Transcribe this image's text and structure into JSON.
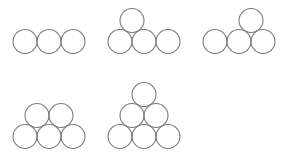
{
  "diagram": {
    "stroke_color": "#7a7a7a",
    "radius": 12,
    "groups": [
      {
        "name": "row-of-three",
        "circles": [
          {
            "cx": 25,
            "cy": 41.5
          },
          {
            "cx": 49,
            "cy": 41.5
          },
          {
            "cx": 73,
            "cy": 41.5
          }
        ]
      },
      {
        "name": "four-with-top-between-first-and-second",
        "circles": [
          {
            "cx": 120,
            "cy": 41.5
          },
          {
            "cx": 144,
            "cy": 41.5
          },
          {
            "cx": 168,
            "cy": 41.5
          },
          {
            "cx": 132,
            "cy": 20.5
          }
        ]
      },
      {
        "name": "four-with-top-between-second-and-third",
        "circles": [
          {
            "cx": 215,
            "cy": 41.5
          },
          {
            "cx": 239,
            "cy": 41.5
          },
          {
            "cx": 263,
            "cy": 41.5
          },
          {
            "cx": 251,
            "cy": 20.5
          }
        ]
      },
      {
        "name": "five-two-over-three",
        "circles": [
          {
            "cx": 25,
            "cy": 136.5
          },
          {
            "cx": 49,
            "cy": 136.5
          },
          {
            "cx": 73,
            "cy": 136.5
          },
          {
            "cx": 37,
            "cy": 115.5
          },
          {
            "cx": 61,
            "cy": 115.5
          }
        ]
      },
      {
        "name": "six-triangle",
        "circles": [
          {
            "cx": 120,
            "cy": 136.5
          },
          {
            "cx": 144,
            "cy": 136.5
          },
          {
            "cx": 168,
            "cy": 136.5
          },
          {
            "cx": 132,
            "cy": 115.5
          },
          {
            "cx": 156,
            "cy": 115.5
          },
          {
            "cx": 144,
            "cy": 94.5
          }
        ]
      }
    ]
  }
}
